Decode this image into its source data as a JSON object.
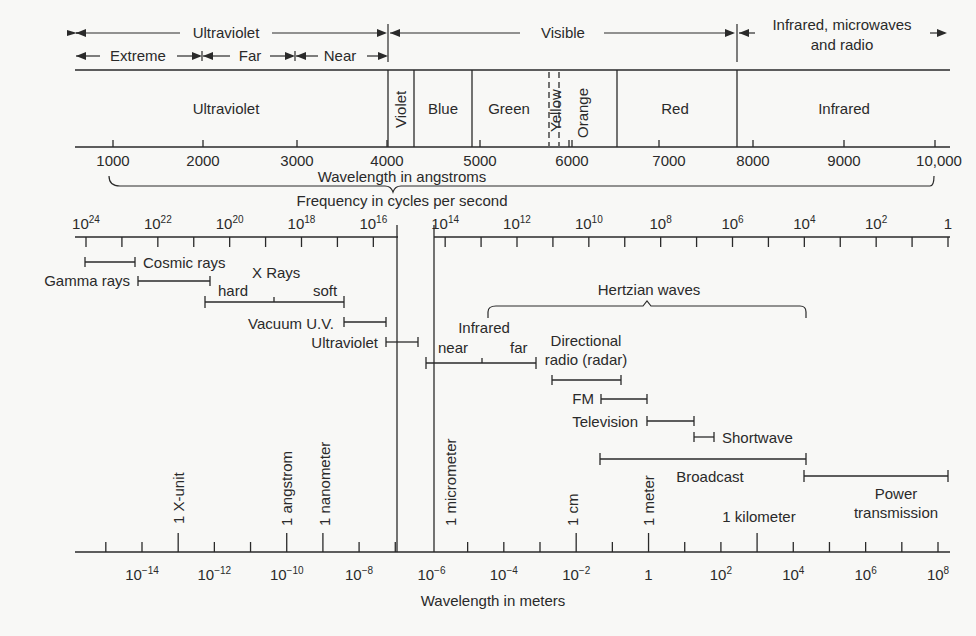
{
  "top_bands": {
    "ultraviolet": "Ultraviolet",
    "extreme": "Extreme",
    "far": "Far",
    "near": "Near",
    "visible": "Visible",
    "infrared_line1": "Infrared, microwaves",
    "infrared_line2": "and radio"
  },
  "color_bands": {
    "ultraviolet": "Ultraviolet",
    "violet": "Violet",
    "blue": "Blue",
    "green": "Green",
    "yellow": "Yellow",
    "orange": "Orange",
    "red": "Red",
    "infrared": "Infrared"
  },
  "angstrom_axis": {
    "label": "Wavelength in angstroms",
    "ticks": [
      "1000",
      "2000",
      "3000",
      "4000",
      "5000",
      "6000",
      "7000",
      "8000",
      "9000",
      "10,000"
    ]
  },
  "frequency_axis": {
    "label": "Frequency in cycles per second",
    "ticks": [
      {
        "base": "10",
        "exp": "24"
      },
      {
        "base": "10",
        "exp": "22"
      },
      {
        "base": "10",
        "exp": "20"
      },
      {
        "base": "10",
        "exp": "18"
      },
      {
        "base": "10",
        "exp": "16"
      },
      {
        "base": "10",
        "exp": "14"
      },
      {
        "base": "10",
        "exp": "12"
      },
      {
        "base": "10",
        "exp": "10"
      },
      {
        "base": "10",
        "exp": "8"
      },
      {
        "base": "10",
        "exp": "6"
      },
      {
        "base": "10",
        "exp": "4"
      },
      {
        "base": "10",
        "exp": "2"
      },
      {
        "base": "1",
        "exp": ""
      }
    ]
  },
  "ranges": {
    "cosmic_rays": "Cosmic rays",
    "gamma_rays": "Gamma rays",
    "x_rays": "X Rays",
    "hard": "hard",
    "soft": "soft",
    "vacuum_uv": "Vacuum U.V.",
    "ultraviolet": "Ultraviolet",
    "infrared": "Infrared",
    "ir_near": "near",
    "ir_far": "far",
    "hertzian": "Hertzian waves",
    "directional_1": "Directional",
    "directional_2": "radio (radar)",
    "fm": "FM",
    "television": "Television",
    "shortwave": "Shortwave",
    "broadcast": "Broadcast",
    "power_1": "Power",
    "power_2": "transmission"
  },
  "unit_markers": {
    "x_unit": "1 X-unit",
    "angstrom": "1 angstrom",
    "nanometer": "1 nanometer",
    "micrometer": "1 micrometer",
    "cm": "1 cm",
    "meter": "1 meter",
    "kilometer": "1 kilometer"
  },
  "meter_axis": {
    "label": "Wavelength in meters",
    "ticks": [
      {
        "base": "10",
        "exp": "−14"
      },
      {
        "base": "10",
        "exp": "−12"
      },
      {
        "base": "10",
        "exp": "−10"
      },
      {
        "base": "10",
        "exp": "−8"
      },
      {
        "base": "10",
        "exp": "−6"
      },
      {
        "base": "10",
        "exp": "−4"
      },
      {
        "base": "10",
        "exp": "−2"
      },
      {
        "base": "1",
        "exp": ""
      },
      {
        "base": "10",
        "exp": "2"
      },
      {
        "base": "10",
        "exp": "4"
      },
      {
        "base": "10",
        "exp": "6"
      },
      {
        "base": "10",
        "exp": "8"
      }
    ]
  }
}
